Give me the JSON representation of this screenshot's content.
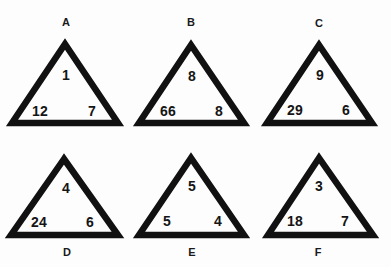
{
  "puzzle": {
    "triangles": [
      {
        "label": "A",
        "top": "1",
        "left": "12",
        "right": "7"
      },
      {
        "label": "B",
        "top": "8",
        "left": "66",
        "right": "8"
      },
      {
        "label": "C",
        "top": "9",
        "left": "29",
        "right": "6"
      },
      {
        "label": "D",
        "top": "4",
        "left": "24",
        "right": "6"
      },
      {
        "label": "E",
        "top": "5",
        "left": "5",
        "right": "4"
      },
      {
        "label": "F",
        "top": "3",
        "left": "18",
        "right": "7"
      }
    ]
  },
  "colors": {
    "stroke": "#111111",
    "background": "#fdfdfd",
    "text": "#151515"
  }
}
